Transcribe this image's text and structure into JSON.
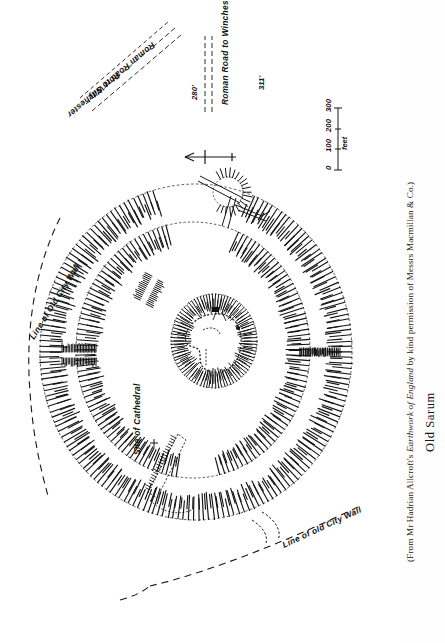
{
  "figure": {
    "title": "Old Sarum",
    "credit_prefix": "(From Mr Hadrian Allcroft's ",
    "credit_italic": "Earthwork of England",
    "credit_suffix": " by kind permission of Messrs Macmillan & Co.)",
    "type": "archaeological-site-plan",
    "orientation_note": "plan rotated 90 degrees on the page"
  },
  "labels": {
    "roman_road_silchester": "Roman Road to Silchester",
    "portway": "Port Way",
    "elevation_280": "280'",
    "roman_road_winchester": "Roman Road to Winchester",
    "elevation_311": "311'",
    "line_of_old_city_wall_left": "Line of Old City Wall",
    "line_of_old_city_wall_bottom": "Line of old City Wall",
    "site_of_cathedral": "Site of Cathedral"
  },
  "scale_bar": {
    "ticks": [
      "0",
      "100",
      "200",
      "300"
    ],
    "unit": "feet"
  },
  "north_arrow": {
    "name": "north-arrow",
    "points_to": "left"
  },
  "map_features": [
    {
      "name": "outer-rampart-ring",
      "kind": "earthwork-bank-hachured"
    },
    {
      "name": "inner-rampart-ring",
      "kind": "earthwork-bank-hachured"
    },
    {
      "name": "motte-ring",
      "kind": "earthwork-bank-hachured"
    },
    {
      "name": "keep-outline",
      "kind": "building-plan"
    },
    {
      "name": "east-gate-causeway",
      "kind": "causeway"
    },
    {
      "name": "west-gate-causeway",
      "kind": "causeway"
    },
    {
      "name": "postern-earthwork",
      "kind": "earthwork-bank-hachured"
    },
    {
      "name": "cathedral-outline",
      "kind": "building-plan"
    },
    {
      "name": "city-wall-dashed-line",
      "kind": "dashed-boundary"
    }
  ]
}
